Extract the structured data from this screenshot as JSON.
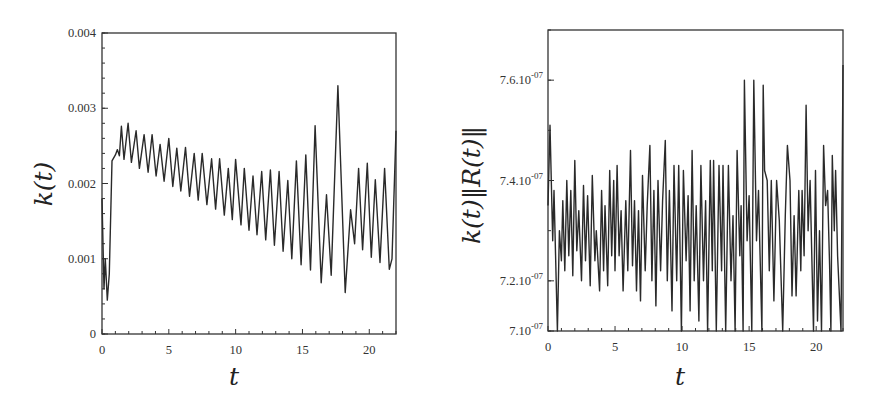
{
  "chart_data": [
    {
      "type": "line",
      "title": "",
      "xlabel": "t",
      "ylabel": "k(t)",
      "xlim": [
        0,
        22
      ],
      "ylim": [
        0,
        0.004
      ],
      "grid": false,
      "legend": null,
      "x_ticks": [
        "0",
        "5",
        "10",
        "15",
        "20"
      ],
      "y_ticks": [
        "0",
        "0.001",
        "0.002",
        "0.003",
        "0.004"
      ],
      "series": [
        {
          "name": "k(t)",
          "description": "Drops sharply to ~0.00045 near t=0.4, jumps to ~0.0024 at t=1, then oscillates with period ~0.65 while the baseline decays linearly from ~0.0024 to ~0.001 by t≈15; irregular large oscillations after t≈15 with max peak ~0.0033 at t≈17.7 and minimum ~0.00055 at t≈18.2; ends rising to ~0.0027 at t=22.",
          "points": [
            [
              0.0,
              0.0018
            ],
            [
              0.15,
              0.0006
            ],
            [
              0.25,
              0.001
            ],
            [
              0.4,
              0.00045
            ],
            [
              0.55,
              0.0008
            ],
            [
              0.75,
              0.0023
            ],
            [
              1.0,
              0.00238
            ],
            [
              1.15,
              0.00245
            ],
            [
              1.3,
              0.00237
            ],
            [
              1.45,
              0.00276
            ],
            [
              1.65,
              0.00232
            ],
            [
              1.95,
              0.0028
            ],
            [
              2.2,
              0.00228
            ],
            [
              2.55,
              0.0027
            ],
            [
              2.8,
              0.0022
            ],
            [
              3.15,
              0.00265
            ],
            [
              3.45,
              0.00215
            ],
            [
              3.75,
              0.00265
            ],
            [
              4.05,
              0.0021
            ],
            [
              4.35,
              0.00252
            ],
            [
              4.65,
              0.00203
            ],
            [
              5.0,
              0.0026
            ],
            [
              5.3,
              0.00196
            ],
            [
              5.6,
              0.00247
            ],
            [
              5.9,
              0.0019
            ],
            [
              6.25,
              0.00248
            ],
            [
              6.55,
              0.00183
            ],
            [
              6.9,
              0.0024
            ],
            [
              7.2,
              0.00178
            ],
            [
              7.5,
              0.0024
            ],
            [
              7.85,
              0.00172
            ],
            [
              8.2,
              0.00233
            ],
            [
              8.5,
              0.00166
            ],
            [
              8.8,
              0.00233
            ],
            [
              9.15,
              0.00158
            ],
            [
              9.45,
              0.0022
            ],
            [
              9.75,
              0.00152
            ],
            [
              10.0,
              0.00232
            ],
            [
              10.4,
              0.00145
            ],
            [
              10.65,
              0.0022
            ],
            [
              11.0,
              0.00138
            ],
            [
              11.3,
              0.0021
            ],
            [
              11.6,
              0.00132
            ],
            [
              11.95,
              0.00216
            ],
            [
              12.25,
              0.00125
            ],
            [
              12.6,
              0.00218
            ],
            [
              12.9,
              0.00118
            ],
            [
              13.25,
              0.00216
            ],
            [
              13.55,
              0.0011
            ],
            [
              13.9,
              0.00204
            ],
            [
              14.2,
              0.001
            ],
            [
              14.55,
              0.0023
            ],
            [
              14.9,
              0.00092
            ],
            [
              15.25,
              0.00238
            ],
            [
              15.6,
              0.00085
            ],
            [
              15.95,
              0.00277
            ],
            [
              16.4,
              0.00068
            ],
            [
              16.8,
              0.00185
            ],
            [
              17.15,
              0.00078
            ],
            [
              17.65,
              0.0033
            ],
            [
              18.2,
              0.00055
            ],
            [
              18.6,
              0.00165
            ],
            [
              18.9,
              0.0012
            ],
            [
              19.2,
              0.0022
            ],
            [
              19.5,
              0.00112
            ],
            [
              19.85,
              0.00227
            ],
            [
              20.15,
              0.00102
            ],
            [
              20.45,
              0.00205
            ],
            [
              20.8,
              0.00095
            ],
            [
              21.15,
              0.0022
            ],
            [
              21.5,
              0.00086
            ],
            [
              21.7,
              0.001
            ],
            [
              22.0,
              0.0027
            ]
          ]
        }
      ]
    },
    {
      "type": "line",
      "title": "",
      "xlabel": "t",
      "ylabel": "k(t)||R(t)||",
      "xlim": [
        0,
        22
      ],
      "ylim": [
        7.1e-07,
        7.7e-07
      ],
      "grid": false,
      "legend": null,
      "x_ticks": [
        "0",
        "5",
        "10",
        "15",
        "20"
      ],
      "y_ticks": [
        "7.10-07",
        "7.2.10-07",
        "7.4.10-07",
        "7.6.10-07"
      ],
      "series": [
        {
          "name": "k(t)||R(t)||",
          "description": "Starts at ~7.51e-7, dips to ~7.10e-7 at t≈0.7, then rapid oscillations between ~7.2e-7 and ~7.45e-7 with growing amplitude; spikes to ~7.60e-7 at t≈14.6 and t≈15.3, ~7.59e-7 at t≈16; minima near 7.10e-7 around t≈19.8 and 21; ends at ~7.63e-7 at t=22.",
          "points": [
            [
              0.0,
              7.35e-07
            ],
            [
              0.15,
              7.51e-07
            ],
            [
              0.35,
              7.28e-07
            ],
            [
              0.45,
              7.38e-07
            ],
            [
              0.7,
              7.1e-07
            ],
            [
              0.85,
              7.3e-07
            ],
            [
              1.0,
              7.24e-07
            ],
            [
              1.1,
              7.36e-07
            ],
            [
              1.25,
              7.22e-07
            ],
            [
              1.4,
              7.4e-07
            ],
            [
              1.55,
              7.25e-07
            ],
            [
              1.7,
              7.38e-07
            ],
            [
              1.85,
              7.21e-07
            ],
            [
              2.0,
              7.44e-07
            ],
            [
              2.15,
              7.26e-07
            ],
            [
              2.3,
              7.34e-07
            ],
            [
              2.5,
              7.2e-07
            ],
            [
              2.65,
              7.39e-07
            ],
            [
              2.8,
              7.24e-07
            ],
            [
              2.95,
              7.37e-07
            ],
            [
              3.15,
              7.19e-07
            ],
            [
              3.3,
              7.41e-07
            ],
            [
              3.5,
              7.24e-07
            ],
            [
              3.6,
              7.3e-07
            ],
            [
              3.85,
              7.18e-07
            ],
            [
              4.0,
              7.38e-07
            ],
            [
              4.15,
              7.22e-07
            ],
            [
              4.25,
              7.35e-07
            ],
            [
              4.45,
              7.19e-07
            ],
            [
              4.6,
              7.42e-07
            ],
            [
              4.75,
              7.25e-07
            ],
            [
              4.9,
              7.4e-07
            ],
            [
              5.0,
              7.22e-07
            ],
            [
              5.15,
              7.43e-07
            ],
            [
              5.3,
              7.25e-07
            ],
            [
              5.45,
              7.34e-07
            ],
            [
              5.6,
              7.18e-07
            ],
            [
              5.8,
              7.36e-07
            ],
            [
              5.95,
              7.22e-07
            ],
            [
              6.15,
              7.46e-07
            ],
            [
              6.3,
              7.23e-07
            ],
            [
              6.45,
              7.36e-07
            ],
            [
              6.6,
              7.18e-07
            ],
            [
              6.75,
              7.34e-07
            ],
            [
              6.9,
              7.16e-07
            ],
            [
              7.05,
              7.41e-07
            ],
            [
              7.25,
              7.22e-07
            ],
            [
              7.4,
              7.35e-07
            ],
            [
              7.6,
              7.47e-07
            ],
            [
              7.75,
              7.2e-07
            ],
            [
              7.9,
              7.38e-07
            ],
            [
              8.05,
              7.15e-07
            ],
            [
              8.2,
              7.4e-07
            ],
            [
              8.4,
              7.22e-07
            ],
            [
              8.55,
              7.36e-07
            ],
            [
              8.75,
              7.48e-07
            ],
            [
              8.9,
              7.2e-07
            ],
            [
              9.05,
              7.38e-07
            ],
            [
              9.25,
              7.14e-07
            ],
            [
              9.4,
              7.43e-07
            ],
            [
              9.6,
              7.2e-07
            ],
            [
              9.75,
              7.43e-07
            ],
            [
              9.95,
              7.1e-07
            ],
            [
              10.1,
              7.42e-07
            ],
            [
              10.3,
              7.24e-07
            ],
            [
              10.45,
              7.37e-07
            ],
            [
              10.6,
              7.14e-07
            ],
            [
              10.75,
              7.46e-07
            ],
            [
              10.9,
              7.2e-07
            ],
            [
              11.05,
              7.35e-07
            ],
            [
              11.25,
              7.12e-07
            ],
            [
              11.4,
              7.43e-07
            ],
            [
              11.6,
              7.2e-07
            ],
            [
              11.75,
              7.36e-07
            ],
            [
              11.9,
              7.08e-07
            ],
            [
              12.1,
              7.44e-07
            ],
            [
              12.25,
              7.22e-07
            ],
            [
              12.35,
              7.44e-07
            ],
            [
              12.55,
              7.06e-07
            ],
            [
              12.75,
              7.43e-07
            ],
            [
              12.95,
              7.22e-07
            ],
            [
              13.05,
              7.43e-07
            ],
            [
              13.25,
              7.05e-07
            ],
            [
              13.45,
              7.43e-07
            ],
            [
              13.65,
              7.2e-07
            ],
            [
              13.8,
              7.33e-07
            ],
            [
              13.95,
              7.06e-07
            ],
            [
              14.1,
              7.46e-07
            ],
            [
              14.3,
              7.25e-07
            ],
            [
              14.4,
              7.35e-07
            ],
            [
              14.55,
              7.09e-07
            ],
            [
              14.65,
              7.6e-07
            ],
            [
              14.85,
              7.28e-07
            ],
            [
              15.0,
              7.37e-07
            ],
            [
              15.2,
              7.07e-07
            ],
            [
              15.35,
              7.6e-07
            ],
            [
              15.55,
              7.28e-07
            ],
            [
              15.7,
              7.38e-07
            ],
            [
              15.95,
              7.04e-07
            ],
            [
              16.05,
              7.59e-07
            ],
            [
              16.15,
              7.42e-07
            ],
            [
              16.35,
              7.4e-07
            ],
            [
              16.5,
              7.22e-07
            ],
            [
              16.65,
              7.4e-07
            ],
            [
              16.85,
              7.16e-07
            ],
            [
              17.05,
              7.4e-07
            ],
            [
              17.25,
              7.32e-07
            ],
            [
              17.5,
              7.06e-07
            ],
            [
              17.7,
              7.33e-07
            ],
            [
              17.85,
              7.47e-07
            ],
            [
              18.05,
              7.4e-07
            ],
            [
              18.2,
              7.17e-07
            ],
            [
              18.35,
              7.33e-07
            ],
            [
              18.5,
              7.17e-07
            ],
            [
              18.7,
              7.38e-07
            ],
            [
              18.85,
              7.22e-07
            ],
            [
              18.95,
              7.38e-07
            ],
            [
              19.1,
              7.25e-07
            ],
            [
              19.25,
              7.55e-07
            ],
            [
              19.4,
              7.3e-07
            ],
            [
              19.55,
              7.4e-07
            ],
            [
              19.8,
              7.01e-07
            ],
            [
              19.95,
              7.42e-07
            ],
            [
              20.1,
              7.12e-07
            ],
            [
              20.25,
              7.3e-07
            ],
            [
              20.4,
              7.04e-07
            ],
            [
              20.55,
              7.47e-07
            ],
            [
              20.7,
              7.35e-07
            ],
            [
              20.85,
              7.38e-07
            ],
            [
              21.0,
              7.23e-07
            ],
            [
              21.1,
              7e-07
            ],
            [
              21.2,
              7.45e-07
            ],
            [
              21.35,
              7.3e-07
            ],
            [
              21.45,
              7.42e-07
            ],
            [
              21.6,
              7.25e-07
            ],
            [
              21.85,
              7.04e-07
            ],
            [
              22.0,
              7.63e-07
            ]
          ]
        }
      ]
    }
  ],
  "left_chart": {
    "ylabel": "k(t)",
    "xlabel": "t",
    "x_ticks": [
      "0",
      "5",
      "10",
      "15",
      "20"
    ],
    "y_ticks": [
      "0",
      "0.001",
      "0.002",
      "0.003",
      "0.004"
    ]
  },
  "right_chart": {
    "ylabel": "k(t)‖R(t)‖",
    "xlabel": "t",
    "x_ticks": [
      "0",
      "5",
      "10",
      "15",
      "20"
    ],
    "y_ticks": [
      {
        "mantissa": "7.",
        "base": "10",
        "exp": "-07"
      },
      {
        "mantissa": "7.2.",
        "base": "10",
        "exp": "-07"
      },
      {
        "mantissa": "7.4.",
        "base": "10",
        "exp": "-07"
      },
      {
        "mantissa": "7.6.",
        "base": "10",
        "exp": "-07"
      }
    ]
  },
  "colors": {
    "line": "#2a2a2a",
    "frame": "#333333",
    "background": "#ffffff"
  }
}
